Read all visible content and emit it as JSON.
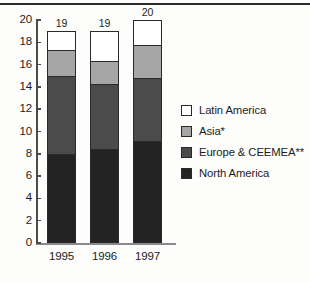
{
  "chart_data": {
    "type": "bar",
    "subtype": "stacked-vertical",
    "title": "",
    "xlabel": "",
    "ylabel": "",
    "categories": [
      "1995",
      "1996",
      "1997"
    ],
    "ylim": [
      0,
      20
    ],
    "ytick_labels": [
      "0",
      "2",
      "4",
      "6",
      "8",
      "10",
      "12",
      "14",
      "16",
      "18",
      "20"
    ],
    "ytick_values": [
      0,
      2,
      4,
      6,
      8,
      10,
      12,
      14,
      16,
      18,
      20
    ],
    "grid": false,
    "legend_position": "right",
    "series": [
      {
        "name": "North America",
        "color": "#232323",
        "values": [
          8.0,
          8.4,
          9.1
        ]
      },
      {
        "name": "Europe & CEEMEA**",
        "color": "#4b4b4b",
        "values": [
          7.0,
          5.9,
          5.7
        ]
      },
      {
        "name": "Asia*",
        "color": "#a6a6a6",
        "values": [
          2.4,
          2.1,
          3.0
        ]
      },
      {
        "name": "Latin America",
        "color": "#ffffff",
        "values": [
          1.6,
          2.6,
          2.2
        ]
      }
    ],
    "bar_totals": [
      "19",
      "19",
      "20"
    ],
    "totals_values": [
      19,
      19,
      20
    ],
    "legend_order": [
      "Latin America",
      "Asia*",
      "Europe & CEEMEA**",
      "North America"
    ]
  },
  "axis": {
    "y_ticks": [
      {
        "label": "20",
        "value": 20
      },
      {
        "label": "18",
        "value": 18
      },
      {
        "label": "16",
        "value": 16
      },
      {
        "label": "14",
        "value": 14
      },
      {
        "label": "12",
        "value": 12
      },
      {
        "label": "10",
        "value": 10
      },
      {
        "label": "8",
        "value": 8
      },
      {
        "label": "6",
        "value": 6
      },
      {
        "label": "4",
        "value": 4
      },
      {
        "label": "2",
        "value": 2
      },
      {
        "label": "0",
        "value": 0
      }
    ],
    "x_labels": [
      "1995",
      "1996",
      "1997"
    ]
  },
  "legend": {
    "items": [
      {
        "label": "Latin America",
        "color": "#ffffff"
      },
      {
        "label": "Asia*",
        "color": "#a6a6a6"
      },
      {
        "label": "Europe & CEEMEA**",
        "color": "#4b4b4b"
      },
      {
        "label": "North America",
        "color": "#232323"
      }
    ]
  },
  "bars": [
    {
      "category": "1995",
      "total_label": "19",
      "segments": [
        {
          "name": "Latin America",
          "value": 1.6,
          "top": 19.0,
          "bottom": 17.4
        },
        {
          "name": "Asia*",
          "value": 2.4,
          "top": 17.4,
          "bottom": 15.0
        },
        {
          "name": "Europe & CEEMEA**",
          "value": 7.0,
          "top": 15.0,
          "bottom": 8.0
        },
        {
          "name": "North America",
          "value": 8.0,
          "top": 8.0,
          "bottom": 0
        }
      ]
    },
    {
      "category": "1996",
      "total_label": "19",
      "segments": [
        {
          "name": "Latin America",
          "value": 2.6,
          "top": 19.0,
          "bottom": 16.4
        },
        {
          "name": "Asia*",
          "value": 2.1,
          "top": 16.4,
          "bottom": 14.3
        },
        {
          "name": "Europe & CEEMEA**",
          "value": 5.9,
          "top": 14.3,
          "bottom": 8.4
        },
        {
          "name": "North America",
          "value": 8.4,
          "top": 8.4,
          "bottom": 0
        }
      ]
    },
    {
      "category": "1997",
      "total_label": "20",
      "segments": [
        {
          "name": "Latin America",
          "value": 2.2,
          "top": 20.0,
          "bottom": 17.8
        },
        {
          "name": "Asia*",
          "value": 3.0,
          "top": 17.8,
          "bottom": 14.8
        },
        {
          "name": "Europe & CEEMEA**",
          "value": 5.7,
          "top": 14.8,
          "bottom": 9.1
        },
        {
          "name": "North America",
          "value": 9.1,
          "top": 9.1,
          "bottom": 0
        }
      ]
    }
  ]
}
